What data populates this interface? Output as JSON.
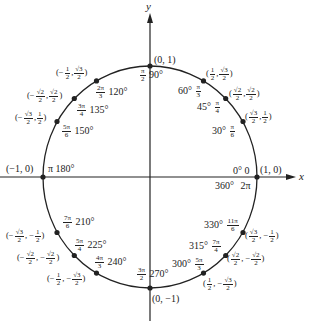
{
  "axes": {
    "x_label": "x",
    "y_label": "y"
  },
  "colors": {
    "stroke": "#222222",
    "background": "#ffffff"
  },
  "circle": {
    "center_px": [
      150,
      177
    ],
    "rx_px": 107,
    "ry_px": 111
  },
  "points": [
    {
      "id": "p0",
      "coord": "(1, 0)",
      "deg": "0°",
      "rad": "0",
      "deg2": "360°",
      "rad2": "2π"
    },
    {
      "id": "p30",
      "coord_x": {
        "num": "√3",
        "den": "2"
      },
      "coord_y": {
        "num": "1",
        "den": "2"
      },
      "deg": "30°",
      "rad": {
        "num": "π",
        "den": "6"
      }
    },
    {
      "id": "p45",
      "coord_x": {
        "num": "√2",
        "den": "2"
      },
      "coord_y": {
        "num": "√2",
        "den": "2"
      },
      "deg": "45°",
      "rad": {
        "num": "π",
        "den": "4"
      }
    },
    {
      "id": "p60",
      "coord_x": {
        "num": "1",
        "den": "2"
      },
      "coord_y": {
        "num": "√3",
        "den": "2"
      },
      "deg": "60°",
      "rad": {
        "num": "π",
        "den": "3"
      }
    },
    {
      "id": "p90",
      "coord": "(0, 1)",
      "deg": "90°",
      "rad": {
        "num": "π",
        "den": "2"
      }
    },
    {
      "id": "p120",
      "coord_x": {
        "sign": "−",
        "num": "1",
        "den": "2"
      },
      "coord_y": {
        "num": "√3",
        "den": "2"
      },
      "deg": "120°",
      "rad": {
        "num": "2π",
        "den": "3"
      }
    },
    {
      "id": "p135",
      "coord_x": {
        "sign": "−",
        "num": "√2",
        "den": "2"
      },
      "coord_y": {
        "num": "√2",
        "den": "2"
      },
      "deg": "135°",
      "rad": {
        "num": "3π",
        "den": "4"
      }
    },
    {
      "id": "p150",
      "coord_x": {
        "sign": "−",
        "num": "√3",
        "den": "2"
      },
      "coord_y": {
        "num": "1",
        "den": "2"
      },
      "deg": "150°",
      "rad": {
        "num": "5π",
        "den": "6"
      }
    },
    {
      "id": "p180",
      "coord": "(−1, 0)",
      "deg": "180°",
      "rad": "π"
    },
    {
      "id": "p210",
      "coord_x": {
        "sign": "−",
        "num": "√3",
        "den": "2"
      },
      "coord_y": {
        "sign": "−",
        "num": "1",
        "den": "2"
      },
      "deg": "210°",
      "rad": {
        "num": "7π",
        "den": "6"
      }
    },
    {
      "id": "p225",
      "coord_x": {
        "sign": "−",
        "num": "√2",
        "den": "2"
      },
      "coord_y": {
        "sign": "−",
        "num": "√2",
        "den": "2"
      },
      "deg": "225°",
      "rad": {
        "num": "5π",
        "den": "4"
      }
    },
    {
      "id": "p240",
      "coord_x": {
        "sign": "−",
        "num": "1",
        "den": "2"
      },
      "coord_y": {
        "sign": "−",
        "num": "√3",
        "den": "2"
      },
      "deg": "240°",
      "rad": {
        "num": "4π",
        "den": "3"
      }
    },
    {
      "id": "p270",
      "coord": "(0, −1)",
      "deg": "270°",
      "rad": {
        "num": "3π",
        "den": "2"
      }
    },
    {
      "id": "p300",
      "coord_x": {
        "num": "1",
        "den": "2"
      },
      "coord_y": {
        "sign": "−",
        "num": "√3",
        "den": "2"
      },
      "deg": "300°",
      "rad": {
        "num": "5π",
        "den": "3"
      }
    },
    {
      "id": "p315",
      "coord_x": {
        "num": "√2",
        "den": "2"
      },
      "coord_y": {
        "sign": "−",
        "num": "√2",
        "den": "2"
      },
      "deg": "315°",
      "rad": {
        "num": "7π",
        "den": "4"
      }
    },
    {
      "id": "p330",
      "coord_x": {
        "num": "√3",
        "den": "2"
      },
      "coord_y": {
        "sign": "−",
        "num": "1",
        "den": "2"
      },
      "deg": "330°",
      "rad": {
        "num": "11π",
        "den": "6"
      }
    }
  ],
  "text": {
    "open": "(",
    "close": ")",
    "comma": ",",
    "minus": "−",
    "one": "1",
    "two": "2",
    "three": "3",
    "four": "4",
    "six": "6",
    "sqrt2": "√2",
    "sqrt3": "√3",
    "pi": "π",
    "pi2": "2π",
    "pi3": "3π",
    "pi4": "4π",
    "pi5": "5π",
    "pi7": "7π",
    "pi11": "11π",
    "c_1_0": "(1, 0)",
    "c_0_1": "(0, 1)",
    "c_m1_0": "(−1, 0)",
    "c_0_m1": "(0, −1)",
    "d0": "0°",
    "r0": "0",
    "d360": "360°",
    "r360": "2π",
    "d30": "30°",
    "d45": "45°",
    "d60": "60°",
    "d90": "90°",
    "d120": "120°",
    "d135": "135°",
    "d150": "150°",
    "d180": "180°",
    "d210": "210°",
    "d225": "225°",
    "d240": "240°",
    "d270": "270°",
    "d300": "300°",
    "d315": "315°",
    "d330": "330°"
  }
}
